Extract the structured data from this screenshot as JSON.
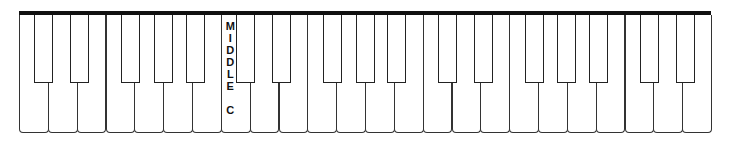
{
  "keyboard": {
    "white_key_count": 24,
    "first_note": "C",
    "last_note": "E",
    "notes": [
      "C",
      "D",
      "E",
      "F",
      "G",
      "A",
      "B",
      "C",
      "D",
      "E",
      "F",
      "G",
      "A",
      "B",
      "C",
      "D",
      "E",
      "F",
      "G",
      "A",
      "B",
      "C",
      "D",
      "E"
    ],
    "middle_c_index": 7,
    "colors": {
      "outline": "#222222",
      "top_bar": "#111111",
      "background": "#ffffff"
    }
  },
  "label": {
    "letters": [
      "M",
      "I",
      "D",
      "D",
      "L",
      "E",
      "",
      "C"
    ],
    "text": "MIDDLE C"
  }
}
